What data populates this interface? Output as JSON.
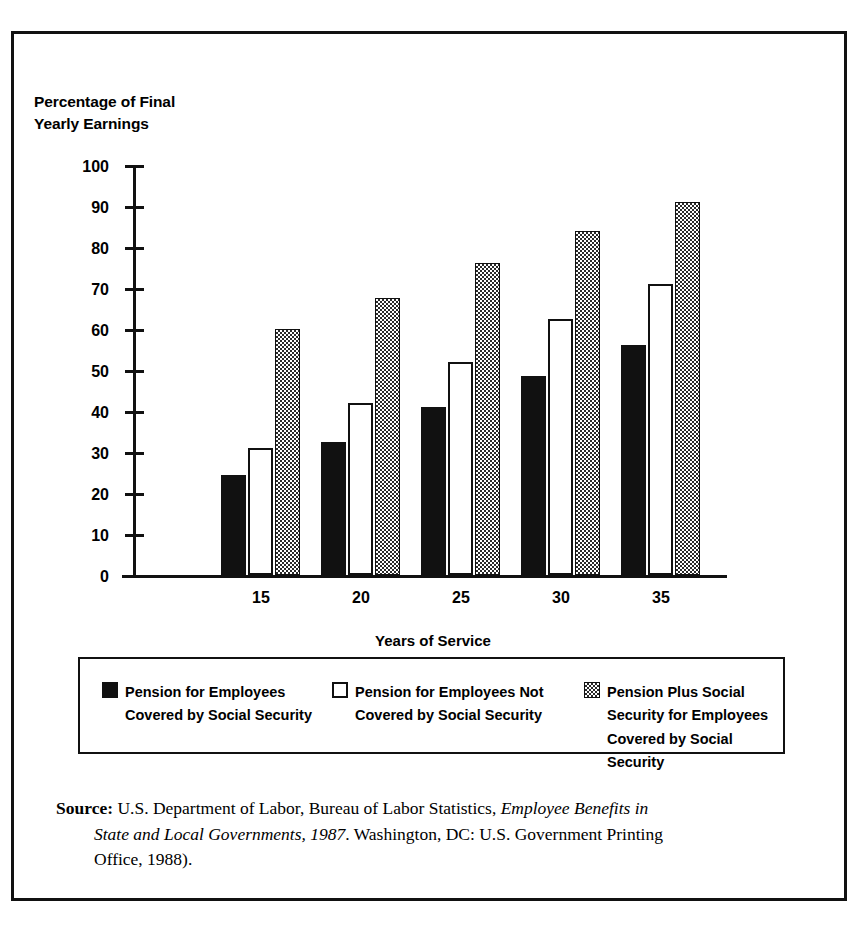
{
  "chart_data": {
    "type": "bar",
    "title": "",
    "ylabel": "Percentage of Final\nYearly Earnings",
    "xlabel": "Years of Service",
    "categories": [
      "15",
      "20",
      "25",
      "30",
      "35"
    ],
    "ylim": [
      0,
      100
    ],
    "ytick_labels": [
      "100",
      "90",
      "80",
      "70",
      "60",
      "50",
      "40",
      "30",
      "20",
      "10",
      "0"
    ],
    "ytick_values": [
      100,
      90,
      80,
      70,
      60,
      50,
      40,
      30,
      20,
      10,
      0
    ],
    "grid": false,
    "legend_position": "below-axes",
    "series": [
      {
        "name": "Pension for Employees\nCovered by Social Security",
        "fill": "solid-black",
        "color": "#111111",
        "values": [
          24.5,
          32.5,
          41,
          48.5,
          56
        ]
      },
      {
        "name": "Pension for Employees Not\nCovered by Social Security",
        "fill": "open-white",
        "color": "#ffffff",
        "values": [
          31,
          42,
          52,
          62.5,
          71
        ]
      },
      {
        "name": "Pension Plus Social\nSecurity for Employees\nCovered by Social Security",
        "fill": "checkered-gray",
        "color": "#2a2a2a",
        "values": [
          60,
          67.5,
          76,
          84,
          91
        ]
      }
    ]
  },
  "legend": {
    "items": [
      {
        "label": "Pension for Employees\nCovered by Social Security"
      },
      {
        "label": "Pension for Employees Not\nCovered by Social Security"
      },
      {
        "label": "Pension Plus Social\nSecurity for Employees\nCovered by Social Security"
      }
    ]
  },
  "source": {
    "prefix": "Source:",
    "line1_plain": " U.S. Department of Labor, Bureau of Labor Statistics, ",
    "line1_italic": "Employee Benefits in",
    "line2_italic": "State and Local Governments, 1987",
    "line2_plain": ". Washington, DC: U.S. Government Printing",
    "line3_plain": "Office, 1988)."
  }
}
